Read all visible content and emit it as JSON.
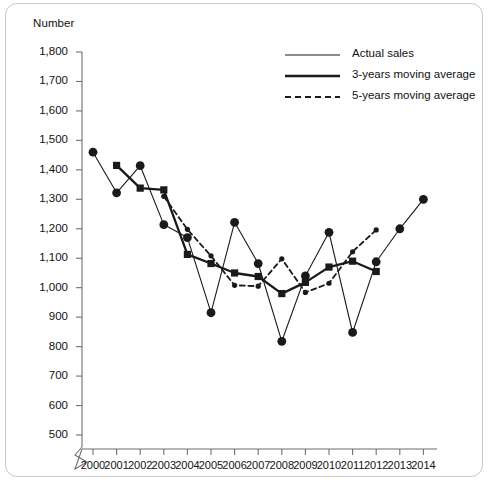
{
  "figure": {
    "y_axis_title": "Number",
    "border_color": "#c9c9c9",
    "line_color": "#1a1a1a"
  },
  "legend": {
    "position": "top-right",
    "entries": [
      {
        "label": "Actual sales",
        "style": "thin-solid",
        "marker": "none"
      },
      {
        "label": "3-years moving average",
        "style": "thick-solid",
        "marker": "none"
      },
      {
        "label": "5-years moving average",
        "style": "dashed",
        "marker": "none"
      }
    ]
  },
  "chart_data": {
    "type": "line",
    "title": "",
    "subtitle": "",
    "xlabel": "",
    "ylabel": "Number",
    "grid": false,
    "axis_break": true,
    "ylim": [
      400,
      1800
    ],
    "yticks": [
      500,
      600,
      700,
      800,
      900,
      1000,
      1100,
      1200,
      1300,
      1400,
      1500,
      1600,
      1700,
      1800
    ],
    "ytick_labels": [
      "500",
      "600",
      "700",
      "800",
      "900",
      "1,000",
      "1,100",
      "1,200",
      "1,300",
      "1,400",
      "1,500",
      "1,600",
      "1,700",
      "1,800"
    ],
    "x": [
      2000,
      2001,
      2002,
      2003,
      2004,
      2005,
      2006,
      2007,
      2008,
      2009,
      2010,
      2011,
      2012,
      2013,
      2014
    ],
    "xtick_labels": [
      "2000",
      "2001",
      "2002",
      "2003",
      "2004",
      "2005",
      "2006",
      "2007",
      "2008",
      "2009",
      "2010",
      "2011",
      "2012",
      "2013",
      "2014"
    ],
    "series": [
      {
        "name": "Actual sales",
        "style": "thin-solid",
        "marker": "circle",
        "x": [
          2000,
          2001,
          2002,
          2003,
          2004,
          2005,
          2006,
          2007,
          2008,
          2009,
          2010,
          2011,
          2012,
          2013,
          2014
        ],
        "values": [
          1460,
          1322,
          1414,
          1214,
          1170,
          915,
          1222,
          1082,
          818,
          1040,
          1188,
          848,
          1088,
          1200,
          1300
        ]
      },
      {
        "name": "3-years moving average",
        "style": "thick-solid",
        "marker": "square",
        "x": [
          2001,
          2002,
          2003,
          2004,
          2005,
          2006,
          2007,
          2008,
          2009,
          2010,
          2011,
          2012
        ],
        "values": [
          1415,
          1338,
          1332,
          1113,
          1082,
          1050,
          1038,
          980,
          1018,
          1070,
          1090,
          1055
        ]
      },
      {
        "name": "5-years moving average",
        "style": "dashed",
        "marker": "small-circle",
        "x": [
          2003,
          2004,
          2005,
          2006,
          2007,
          2008,
          2009,
          2010,
          2011,
          2012
        ],
        "values": [
          1310,
          1198,
          1108,
          1008,
          1005,
          1098,
          984,
          1015,
          1122,
          1196
        ]
      }
    ]
  }
}
